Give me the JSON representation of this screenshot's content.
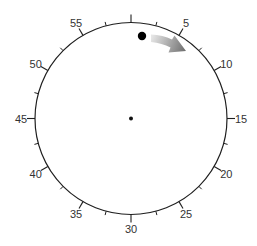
{
  "diagram": {
    "type": "clock-dial",
    "center": [
      131,
      118.5
    ],
    "radius": 96,
    "label_radius": 110,
    "major_tick_length": 8,
    "minor_tick_length": 4,
    "labels": [
      {
        "minute": 5,
        "text": "5"
      },
      {
        "minute": 10,
        "text": "10"
      },
      {
        "minute": 15,
        "text": "15"
      },
      {
        "minute": 20,
        "text": "20"
      },
      {
        "minute": 25,
        "text": "25"
      },
      {
        "minute": 30,
        "text": "30"
      },
      {
        "minute": 35,
        "text": "35"
      },
      {
        "minute": 40,
        "text": "40"
      },
      {
        "minute": 45,
        "text": "45"
      },
      {
        "minute": 50,
        "text": "50"
      },
      {
        "minute": 55,
        "text": "55"
      }
    ],
    "major_ticks": [
      0,
      5,
      10,
      15,
      20,
      25,
      30,
      35,
      40,
      45,
      50,
      55
    ],
    "minor_ticks": [
      2.5,
      7.5,
      12.5,
      17.5,
      22.5,
      27.5,
      32.5,
      37.5,
      42.5,
      47.5,
      52.5,
      57.5
    ],
    "center_dot": {
      "x": 131,
      "y": 118.5,
      "r": 2
    },
    "marker": {
      "x": 142,
      "y": 36,
      "r": 4.2,
      "color": "#000000"
    },
    "arrow": {
      "direction": "clockwise",
      "gradient_start": "#e6e6e6",
      "gradient_end": "#6e6e6e"
    },
    "colors": {
      "stroke": "#1f1f1f",
      "label": "#333333",
      "background": "#ffffff"
    }
  }
}
